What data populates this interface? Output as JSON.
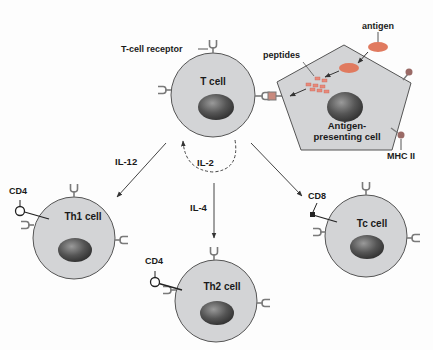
{
  "colors": {
    "cell_fill": "#d3d4d6",
    "cell_stroke": "#555555",
    "nucleus_dark": "#3a3a3a",
    "nucleus_light": "#8c8c8c",
    "antigen": "#e07a5f",
    "peptide": "#e8897a",
    "receptor": "#7a7a7a",
    "text": "#1a1a1a"
  },
  "labels": {
    "t_cell_receptor": "T-cell receptor",
    "t_cell": "T cell",
    "antigen": "antigen",
    "peptides": "peptides",
    "apc_line1": "Antigen-",
    "apc_line2": "presenting cell",
    "mhc": "MHC II",
    "il12": "IL-12",
    "il2": "IL-2",
    "il4": "IL-4",
    "th1": "Th1 cell",
    "th2": "Th2 cell",
    "tc": "Tc cell",
    "cd4_th1": "CD4",
    "cd4_th2": "CD4",
    "cd8": "CD8"
  }
}
